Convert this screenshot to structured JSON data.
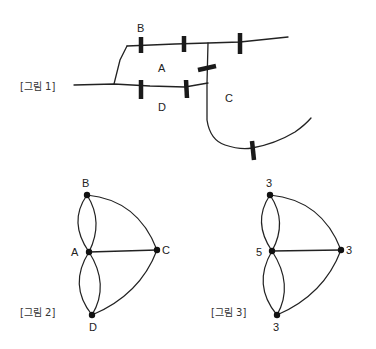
{
  "figure1": {
    "caption": "[그림 1]",
    "regions": {
      "A": "A",
      "B": "B",
      "C": "C",
      "D": "D"
    },
    "bridge_count": 7
  },
  "figure2": {
    "caption": "[그림 2]",
    "nodes": [
      {
        "id": "B",
        "label": "B"
      },
      {
        "id": "A",
        "label": "A"
      },
      {
        "id": "C",
        "label": "C"
      },
      {
        "id": "D",
        "label": "D"
      }
    ],
    "edges": [
      [
        "A",
        "B"
      ],
      [
        "A",
        "B"
      ],
      [
        "A",
        "D"
      ],
      [
        "A",
        "D"
      ],
      [
        "A",
        "C"
      ],
      [
        "B",
        "C"
      ],
      [
        "D",
        "C"
      ]
    ]
  },
  "figure3": {
    "caption": "[그림 3]",
    "node_degrees": {
      "top": "3",
      "middle": "5",
      "right": "3",
      "bottom": "3"
    }
  }
}
